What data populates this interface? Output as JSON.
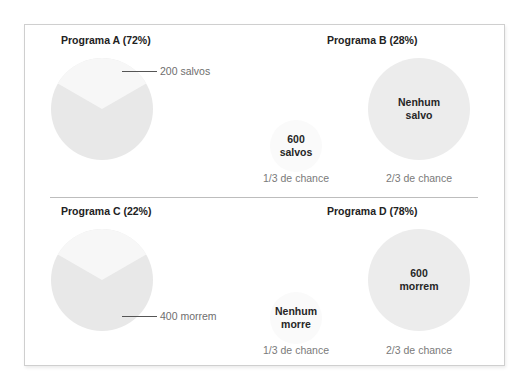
{
  "colors": {
    "pie_major": "#e8e8e8",
    "pie_minor": "#f7f7f7",
    "circle_big": "#ececec",
    "circle_small": "#fafafa",
    "frame_border": "#cfcfcf",
    "title_text": "#222222",
    "chance_text": "#7a7a7a"
  },
  "panels": {
    "a": {
      "title": "Programa A (72%)",
      "callout": "200 salvos"
    },
    "b": {
      "title": "Programa B (28%)",
      "small_label": "600\nsalvos",
      "small_chance": "1/3 de chance",
      "big_label": "Nenhum\nsalvo",
      "big_chance": "2/3 de chance"
    },
    "c": {
      "title": "Programa C (22%)",
      "callout": "400 morrem"
    },
    "d": {
      "title": "Programa D (78%)",
      "small_label": "Nenhum\nmorre",
      "small_chance": "1/3 de chance",
      "big_label": "600\nmorrem",
      "big_chance": "2/3 de chance"
    }
  }
}
